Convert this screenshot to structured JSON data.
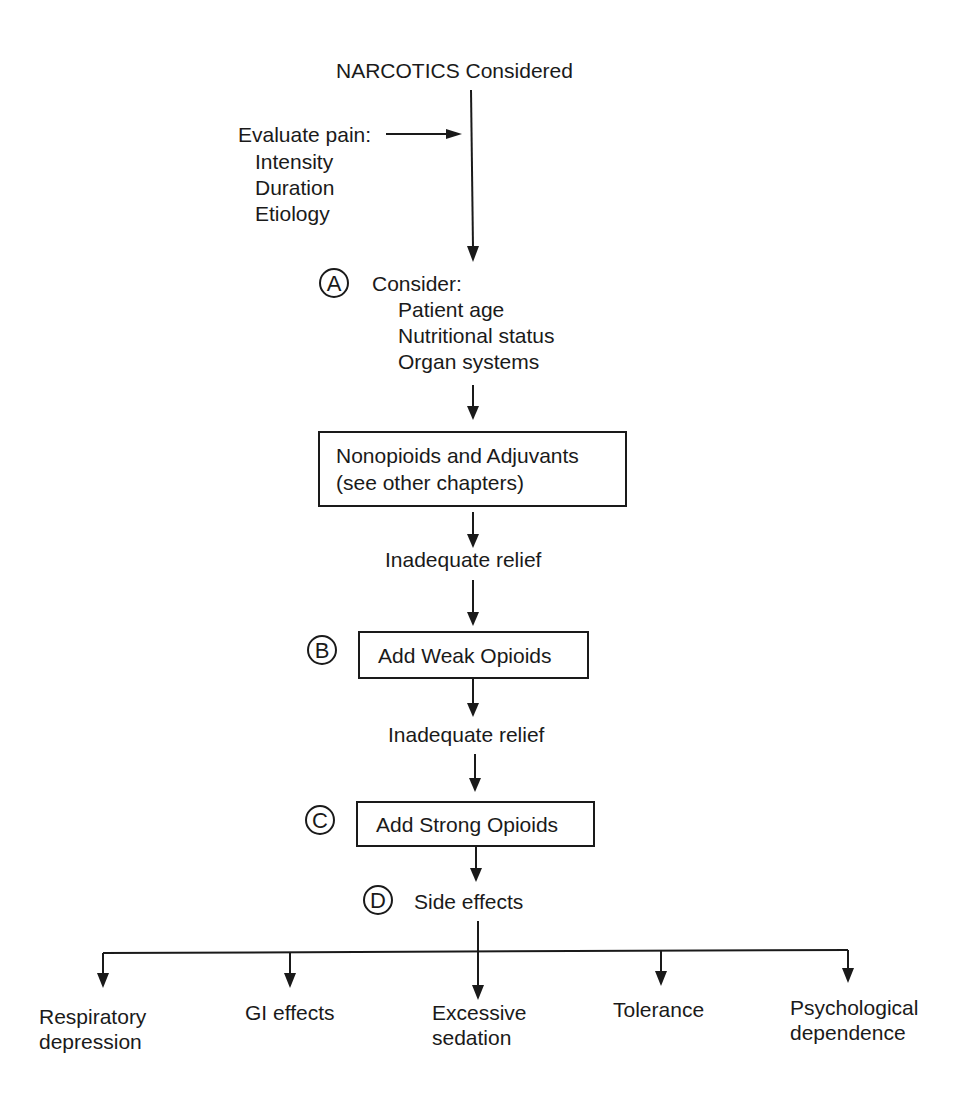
{
  "title": "NARCOTICS Considered",
  "evaluate": {
    "label": "Evaluate pain:",
    "items": [
      "Intensity",
      "Duration",
      "Etiology"
    ]
  },
  "step_a": {
    "marker": "A",
    "label": "Consider:",
    "items": [
      "Patient age",
      "Nutritional status",
      "Organ systems"
    ]
  },
  "nonopioids_box": {
    "line1": "Nonopioids and Adjuvants",
    "line2": "(see other chapters)"
  },
  "inadequate_relief_1": "Inadequate relief",
  "step_b": {
    "marker": "B",
    "label": "Add Weak Opioids"
  },
  "inadequate_relief_2": "Inadequate relief",
  "step_c": {
    "marker": "C",
    "label": "Add Strong Opioids"
  },
  "step_d": {
    "marker": "D",
    "label": "Side effects"
  },
  "side_effects": [
    {
      "line1": "Respiratory",
      "line2": "depression"
    },
    {
      "line1": "GI effects",
      "line2": ""
    },
    {
      "line1": "Excessive",
      "line2": "sedation"
    },
    {
      "line1": "Tolerance",
      "line2": ""
    },
    {
      "line1": "Psychological",
      "line2": "dependence"
    }
  ]
}
